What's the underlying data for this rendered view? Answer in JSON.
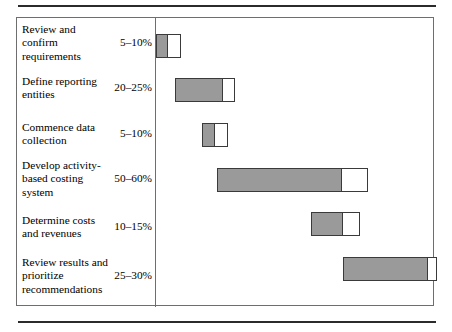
{
  "figure": {
    "kind": "gantt-chart",
    "colors": {
      "solid_fill": "#9a9a9a",
      "open_fill": "#ffffff",
      "bar_stroke": "#3a3a3a",
      "frame_stroke": "#6e6e6e",
      "rule_stroke": "#2b2b2b",
      "background": "#ffffff",
      "text": "#000000"
    }
  },
  "chart_data": {
    "type": "bar",
    "orientation": "horizontal",
    "subtype": "gantt",
    "title": "",
    "xlabel": "",
    "ylabel": "",
    "grid": false,
    "legend": null,
    "xlim": [
      0,
      100
    ],
    "axis_ticks": [],
    "categories": [
      "Review and confirm requirements",
      "Define reporting entities",
      "Commence data collection",
      "Develop activity-based costing system",
      "Determine costs and revenues",
      "Review results and prioritize recommendations"
    ],
    "value_labels": [
      "5–10%",
      "20–25%",
      "5–10%",
      "50–60%",
      "10–15%",
      "25–30%"
    ],
    "series": [
      {
        "name": "Effort range (percent of total project)",
        "values": [
          {
            "low": 5,
            "high": 10
          },
          {
            "low": 20,
            "high": 25
          },
          {
            "low": 5,
            "high": 10
          },
          {
            "low": 50,
            "high": 60
          },
          {
            "low": 10,
            "high": 15
          },
          {
            "low": 25,
            "high": 30
          }
        ]
      }
    ],
    "bars": [
      {
        "label": "Review and confirm requirements",
        "value_label": "5–10%",
        "start_pct": 0.0,
        "solid_end_pct": 4.5,
        "open_end_pct": 9.0
      },
      {
        "label": "Define reporting entities",
        "value_label": "20–25%",
        "start_pct": 6.9,
        "solid_end_pct": 24.2,
        "open_end_pct": 28.5
      },
      {
        "label": "Commence data collection",
        "value_label": "5–10%",
        "start_pct": 16.6,
        "solid_end_pct": 21.3,
        "open_end_pct": 26.0
      },
      {
        "label": "Develop activity-based costing system",
        "value_label": "50–60%",
        "start_pct": 22.0,
        "solid_end_pct": 67.2,
        "open_end_pct": 76.5
      },
      {
        "label": "Determine costs and revenues",
        "value_label": "10–15%",
        "start_pct": 56.0,
        "solid_end_pct": 67.5,
        "open_end_pct": 73.6
      },
      {
        "label": "Review results and prioritize recommendations",
        "value_label": "25–30%",
        "start_pct": 67.5,
        "solid_end_pct": 98.2,
        "open_end_pct": 101.5
      }
    ]
  },
  "rows": [
    {
      "task": "Review and confirm requirements",
      "pct": "5–10%"
    },
    {
      "task": "Define reporting entities",
      "pct": "20–25%"
    },
    {
      "task": "Commence data collection",
      "pct": "5–10%"
    },
    {
      "task": "Develop activity-based costing system",
      "pct": "50–60%"
    },
    {
      "task": "Determine costs and revenues",
      "pct": "10–15%"
    },
    {
      "task": "Review results and prioritize recommendations",
      "pct": "25–30%"
    }
  ]
}
